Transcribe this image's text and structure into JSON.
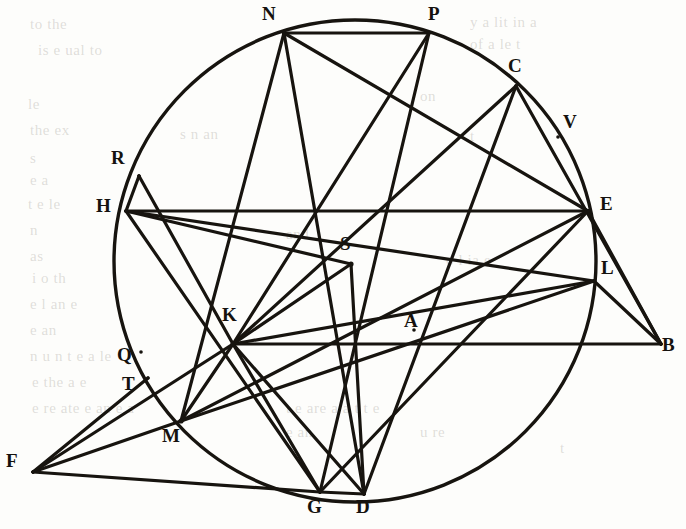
{
  "figure": {
    "canvas": {
      "width": 686,
      "height": 529
    },
    "stroke_color": "#17140f",
    "background_color": "#fdfdfb",
    "circle": {
      "cx": 355,
      "cy": 261,
      "r": 241,
      "stroke_width": 3.4
    },
    "default_line_width": 3.2
  },
  "points": [
    {
      "id": "N",
      "label": "N",
      "x": 284,
      "y": 33,
      "label_x": 262,
      "label_y": 4,
      "on_circle": true
    },
    {
      "id": "P",
      "label": "P",
      "x": 429,
      "y": 33,
      "label_x": 428,
      "label_y": 4,
      "on_circle": true
    },
    {
      "id": "C",
      "label": "C",
      "x": 516,
      "y": 86,
      "label_x": 508,
      "label_y": 56,
      "on_circle": true
    },
    {
      "id": "V",
      "label": "V",
      "x": 558,
      "y": 137,
      "label_x": 563,
      "label_y": 112,
      "on_circle": false
    },
    {
      "id": "R",
      "label": "R",
      "x": 139,
      "y": 176,
      "label_x": 111,
      "label_y": 148,
      "on_circle": true
    },
    {
      "id": "H",
      "label": "H",
      "x": 126,
      "y": 211,
      "label_x": 96,
      "label_y": 196,
      "on_circle": true
    },
    {
      "id": "E",
      "label": "E",
      "x": 588,
      "y": 211,
      "label_x": 600,
      "label_y": 194,
      "on_circle": true
    },
    {
      "id": "S",
      "label": "S",
      "x": 351,
      "y": 264,
      "label_x": 340,
      "label_y": 234,
      "on_circle": false
    },
    {
      "id": "L",
      "label": "L",
      "x": 594,
      "y": 281,
      "label_x": 601,
      "label_y": 258,
      "on_circle": true
    },
    {
      "id": "K",
      "label": "K",
      "x": 233,
      "y": 344,
      "label_x": 222,
      "label_y": 305,
      "on_circle": false
    },
    {
      "id": "A",
      "label": "A",
      "x": 414,
      "y": 330,
      "label_x": 404,
      "label_y": 311,
      "on_circle": false
    },
    {
      "id": "B",
      "label": "B",
      "x": 661,
      "y": 344,
      "label_x": 662,
      "label_y": 335,
      "on_circle": false
    },
    {
      "id": "Q",
      "label": "Q",
      "x": 141,
      "y": 352,
      "label_x": 117,
      "label_y": 345,
      "on_circle": true
    },
    {
      "id": "T",
      "label": "T",
      "x": 148,
      "y": 378,
      "label_x": 122,
      "label_y": 374,
      "on_circle": true
    },
    {
      "id": "M",
      "label": "M",
      "x": 181,
      "y": 421,
      "label_x": 162,
      "label_y": 426,
      "on_circle": true
    },
    {
      "id": "F",
      "label": "F",
      "x": 33,
      "y": 472,
      "label_x": 6,
      "label_y": 451,
      "on_circle": false
    },
    {
      "id": "G",
      "label": "G",
      "x": 320,
      "y": 492,
      "label_x": 307,
      "label_y": 497,
      "on_circle": true
    },
    {
      "id": "D",
      "label": "D",
      "x": 364,
      "y": 494,
      "label_x": 356,
      "label_y": 497,
      "on_circle": true
    }
  ],
  "segments": [
    {
      "id": "NP",
      "from": "N",
      "to": "P"
    },
    {
      "id": "NM",
      "from": "N",
      "to": "M"
    },
    {
      "id": "ND",
      "from": "N",
      "to": "D"
    },
    {
      "id": "NE",
      "from": "N",
      "to": "E"
    },
    {
      "id": "PG",
      "from": "P",
      "to": "G"
    },
    {
      "id": "PK",
      "from": "P",
      "to": "K"
    },
    {
      "id": "CK",
      "from": "C",
      "to": "K"
    },
    {
      "id": "CB",
      "from": "C",
      "to": "B"
    },
    {
      "id": "CD",
      "from": "C",
      "to": "D"
    },
    {
      "id": "RK",
      "from": "R",
      "to": "K"
    },
    {
      "id": "RH",
      "from": "R",
      "to": "H"
    },
    {
      "id": "HE",
      "from": "H",
      "to": "E"
    },
    {
      "id": "HS",
      "from": "H",
      "to": "S"
    },
    {
      "id": "HL",
      "from": "H",
      "to": "L"
    },
    {
      "id": "HG",
      "from": "H",
      "to": "G"
    },
    {
      "id": "SK",
      "from": "S",
      "to": "K"
    },
    {
      "id": "SD",
      "from": "S",
      "to": "D"
    },
    {
      "id": "EB",
      "from": "E",
      "to": "B"
    },
    {
      "id": "EM",
      "from": "E",
      "to": "M"
    },
    {
      "id": "EG",
      "from": "E",
      "to": "G"
    },
    {
      "id": "LB",
      "from": "L",
      "to": "B"
    },
    {
      "id": "LK",
      "from": "L",
      "to": "K"
    },
    {
      "id": "LM",
      "from": "L",
      "to": "M"
    },
    {
      "id": "KB",
      "from": "K",
      "to": "B"
    },
    {
      "id": "KD",
      "from": "K",
      "to": "D"
    },
    {
      "id": "KG",
      "from": "K",
      "to": "G"
    },
    {
      "id": "KF",
      "from": "K",
      "to": "F"
    },
    {
      "id": "KM",
      "from": "K",
      "to": "M"
    },
    {
      "id": "FM",
      "from": "F",
      "to": "M"
    },
    {
      "id": "FG",
      "from": "F",
      "to": "G"
    },
    {
      "id": "FT",
      "from": "F",
      "to": "T"
    },
    {
      "id": "GD",
      "from": "G",
      "to": "D"
    }
  ],
  "background_text": [
    {
      "text": "to the",
      "x": 30,
      "y": 16
    },
    {
      "text": "y a  lit     in  a",
      "x": 470,
      "y": 14
    },
    {
      "text": "of  a  le  t",
      "x": 470,
      "y": 36
    },
    {
      "text": "is   e  ual  to",
      "x": 38,
      "y": 42
    },
    {
      "text": "on",
      "x": 420,
      "y": 88
    },
    {
      "text": "le",
      "x": 28,
      "y": 96
    },
    {
      "text": "the ex",
      "x": 30,
      "y": 122
    },
    {
      "text": "s     n  an",
      "x": 180,
      "y": 126
    },
    {
      "text": "t",
      "x": 470,
      "y": 128
    },
    {
      "text": "s",
      "x": 30,
      "y": 150
    },
    {
      "text": "e a",
      "x": 30,
      "y": 172
    },
    {
      "text": "t   e  le",
      "x": 28,
      "y": 196
    },
    {
      "text": "n",
      "x": 30,
      "y": 222
    },
    {
      "text": "as",
      "x": 30,
      "y": 248
    },
    {
      "text": "and",
      "x": 286,
      "y": 226
    },
    {
      "text": "i  o  th",
      "x": 32,
      "y": 270
    },
    {
      "text": "e  l    an  e",
      "x": 30,
      "y": 296
    },
    {
      "text": "e  an",
      "x": 30,
      "y": 322
    },
    {
      "text": "o  l  ia  e",
      "x": 446,
      "y": 252
    },
    {
      "text": "t",
      "x": 560,
      "y": 440
    },
    {
      "text": "n   u   n t    e  a   le",
      "x": 30,
      "y": 348
    },
    {
      "text": "e the   a  e",
      "x": 32,
      "y": 374
    },
    {
      "text": "e  re  ate   e    an    e  a",
      "x": 32,
      "y": 400
    },
    {
      "text": "t  e  are  a  a  t  t  e",
      "x": 286,
      "y": 400
    },
    {
      "text": "e  an",
      "x": 286,
      "y": 424
    },
    {
      "text": "u    re",
      "x": 420,
      "y": 424
    }
  ]
}
